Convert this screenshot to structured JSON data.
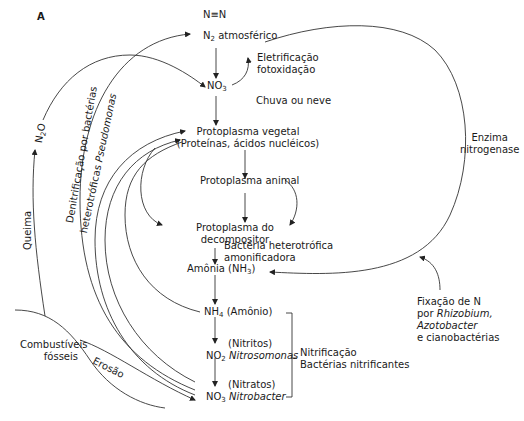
{
  "panel_label": "A",
  "nodes": {
    "n_triple": "N≡N",
    "n2_main": "N",
    "n2_sub": "2",
    "n2_rest": " atmosférico",
    "no3_top_main": "NO",
    "no3_top_sub": "3",
    "proto_vegetal_1": "Protoplasma vegetal",
    "proto_vegetal_2": "(Proteínas, ácidos nucléicos)",
    "proto_animal": "Protoplasma animal",
    "proto_decomp_1": "Protoplasma do",
    "proto_decomp_2": "decompositor",
    "amonia_main": "Amônia (NH",
    "amonia_sub": "3",
    "amonia_close": ")",
    "nh4_main": "NH",
    "nh4_sub": "4",
    "nh4_rest": " (Amônio)",
    "nitritos": "(Nitritos)",
    "no2_main": "NO",
    "no2_sub": "2",
    "nitrosomonas": "Nitrosomonas",
    "nitratos": "(Nitratos)",
    "no3_bottom_main": "NO",
    "no3_bottom_sub": "3",
    "nitrobacter": "Nitrobacter",
    "combustiveis_1": "Combustíveis",
    "combustiveis_2": "fósseis"
  },
  "edge_labels": {
    "eletrificacao_1": "Eletrificação",
    "eletrificacao_2": "fotoxidação",
    "chuva": "Chuva ou neve",
    "enzima_1": "Enzima",
    "enzima_2": "nitrogenase",
    "bacteria_1": "Bactéria heterotrófica",
    "bacteria_2": "amonificadora",
    "nitrificacao_1": "Nitrificação",
    "nitrificacao_2": "Bactérias nitrificantes",
    "fixacao_1": "Fixação de N",
    "fixacao_2a": "por ",
    "fixacao_2b": "Rhizobium,",
    "fixacao_3": "Azotobacter",
    "fixacao_4": "e cianobactérias",
    "queima": "Queima",
    "n2o_main": "N",
    "n2o_sub": "2",
    "n2o_rest": "O",
    "denitrif_1": "Denitrificação por bactérias",
    "denitrif_2a": "heterotróficas ",
    "denitrif_2b": "Pseudomonas",
    "erosao": "Erosão"
  },
  "colors": {
    "line": "#333333",
    "text": "#1a1a1a",
    "background": "#ffffff"
  }
}
